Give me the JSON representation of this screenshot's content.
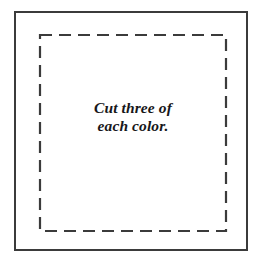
{
  "sheet": {
    "background_color": "#ffffff",
    "width": 262,
    "height": 265
  },
  "outer_frame": {
    "name": "template-outer-frame",
    "stroke_color": "#3b3b3b",
    "stroke_width": 2,
    "style": "solid",
    "x": 14,
    "y": 11,
    "width": 234,
    "height": 240
  },
  "cutting_line": {
    "name": "dashed-cutting-line",
    "stroke_color": "#3b3b3b",
    "stroke_width": 2.2,
    "style": "dashed",
    "dash_length": 12,
    "gap_length": 7,
    "inset": 24
  },
  "instruction": {
    "line1": "Cut three of",
    "line2": "each color.",
    "text_color": "#17171a",
    "style": "bold-italic-serif"
  }
}
